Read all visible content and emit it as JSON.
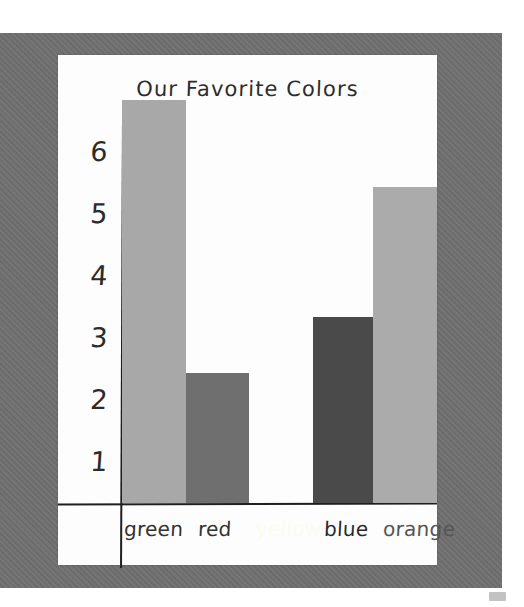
{
  "photo": {
    "board_color": "#707070",
    "paper_color": "#fdfdfd",
    "ink_color": "#1f1f1f"
  },
  "chart_data": {
    "type": "bar",
    "title": "Our Favorite Colors",
    "xlabel": "",
    "ylabel": "",
    "categories": [
      "green",
      "red",
      "yellow",
      "blue",
      "orange"
    ],
    "values": [
      6.5,
      2.1,
      0,
      3.0,
      5.1
    ],
    "ylim": [
      0,
      7
    ],
    "yticks": [
      "6",
      "5",
      "4",
      "3",
      "2",
      "1"
    ],
    "grid": false,
    "legend": false,
    "bar_colors": [
      "#a8a8a8",
      "#6f6f6f",
      "#fcfcf2",
      "#4a4a4a",
      "#ababab"
    ],
    "label_colors": [
      "#333333",
      "#333333",
      "#fbfbef",
      "#2a2a2a",
      "#555555"
    ],
    "note": "Construction-paper bar graph photographed in grayscale; the yellow bar has zero height and its label is nearly invisible against the white paper."
  }
}
